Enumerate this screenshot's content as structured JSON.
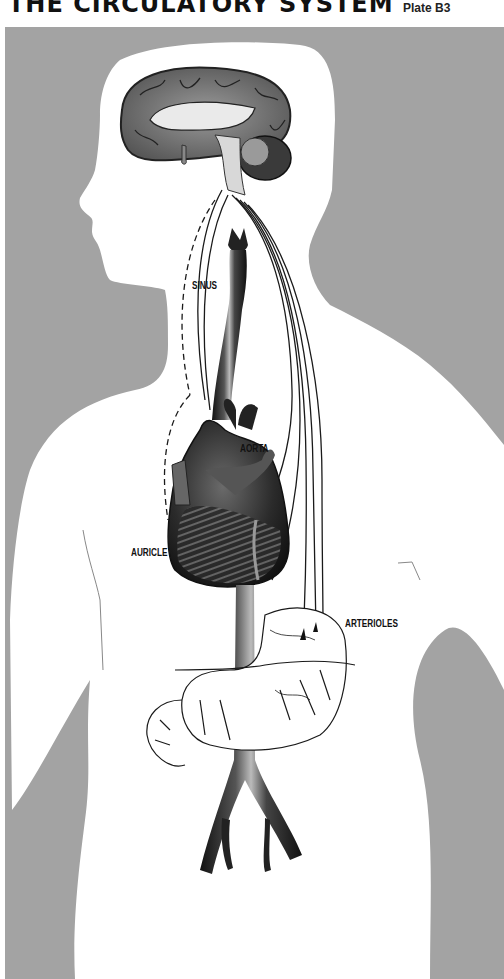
{
  "header": {
    "title": "THE CIRCULATORY SYSTEM",
    "plate": "Plate B3"
  },
  "labels": {
    "sinus": "SINUS",
    "aorta": "AORTA",
    "auricle": "AURICLE",
    "arterioles": "ARTERIOLES"
  },
  "colors": {
    "background_gray": "#a3a3a3",
    "silhouette": "#ffffff",
    "organ_dark": "#2a2a2a",
    "text": "#111111"
  }
}
